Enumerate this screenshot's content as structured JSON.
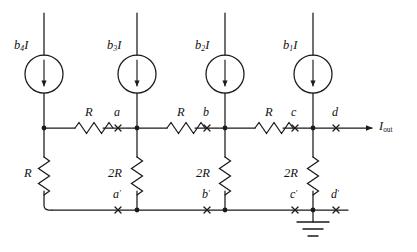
{
  "diagram": {
    "stroke_color": "#1a1a1a",
    "background_color": "#ffffff",
    "bus_label": "I",
    "bus_label_sub": "out",
    "sources": [
      {
        "name": "source-b4",
        "coef": "b",
        "index": "4",
        "unit": "I",
        "x": 44
      },
      {
        "name": "source-b3",
        "coef": "b",
        "index": "3",
        "unit": "I",
        "x": 137
      },
      {
        "name": "source-b2",
        "coef": "b",
        "index": "2",
        "unit": "I",
        "x": 225
      },
      {
        "name": "source-b1",
        "coef": "b",
        "index": "1",
        "unit": "I",
        "x": 313
      }
    ],
    "series_resistors": [
      {
        "name": "series-resistor-1",
        "label": "R",
        "cx": 89
      },
      {
        "name": "series-resistor-2",
        "label": "R",
        "cx": 181
      },
      {
        "name": "series-resistor-3",
        "label": "R",
        "cx": 269
      }
    ],
    "shunt_resistors": [
      {
        "name": "shunt-resistor-left",
        "label": "R",
        "x": 44
      },
      {
        "name": "shunt-resistor-a",
        "label": "2R",
        "x": 137
      },
      {
        "name": "shunt-resistor-b",
        "label": "2R",
        "x": 225
      },
      {
        "name": "shunt-resistor-c",
        "label": "2R",
        "x": 313
      }
    ],
    "top_nodes": [
      {
        "name": "node-a",
        "label": "a",
        "prime": false,
        "x": 118
      },
      {
        "name": "node-b",
        "label": "b",
        "prime": false,
        "x": 207
      },
      {
        "name": "node-c",
        "label": "c",
        "prime": false,
        "x": 295
      },
      {
        "name": "node-d",
        "label": "d",
        "prime": false,
        "x": 336
      }
    ],
    "bottom_nodes": [
      {
        "name": "node-a-prime",
        "label": "a",
        "prime": true,
        "x": 118
      },
      {
        "name": "node-b-prime",
        "label": "b",
        "prime": true,
        "x": 207
      },
      {
        "name": "node-c-prime",
        "label": "c",
        "prime": true,
        "x": 295
      },
      {
        "name": "node-d-prime",
        "label": "d",
        "prime": true,
        "x": 336
      }
    ],
    "ground": {
      "name": "ground-symbol",
      "x": 313,
      "y": 212
    },
    "prime_glyph": "′"
  }
}
